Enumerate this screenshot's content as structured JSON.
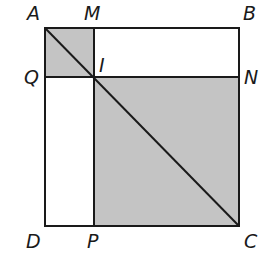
{
  "diagram": {
    "colors": {
      "shade": "#c4c4c4",
      "stroke": "#1a1a1a",
      "background": "#ffffff"
    },
    "points": {
      "A": {
        "label": "A",
        "x": 45,
        "y": 28
      },
      "M": {
        "label": "M",
        "x": 94,
        "y": 28
      },
      "B": {
        "label": "B",
        "x": 239,
        "y": 28
      },
      "Q": {
        "label": "Q",
        "x": 45,
        "y": 77
      },
      "I": {
        "label": "I",
        "x": 94,
        "y": 77
      },
      "N": {
        "label": "N",
        "x": 239,
        "y": 77
      },
      "D": {
        "label": "D",
        "x": 45,
        "y": 226
      },
      "P": {
        "label": "P",
        "x": 94,
        "y": 226
      },
      "C": {
        "label": "C",
        "x": 239,
        "y": 226
      }
    },
    "shaded_regions": [
      "AMIQ",
      "INCP"
    ],
    "segments": [
      "AB",
      "BC",
      "CD",
      "DA",
      "MP",
      "QN",
      "AC"
    ]
  }
}
